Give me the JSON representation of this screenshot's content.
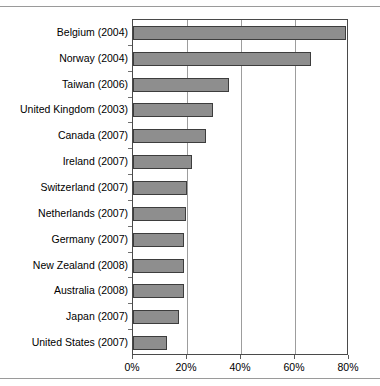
{
  "chart_data": {
    "type": "bar",
    "orientation": "horizontal",
    "title": "",
    "subtitle": "",
    "xlabel": "",
    "ylabel": "",
    "xlim": [
      0,
      80
    ],
    "xtick_labels": [
      "0%",
      "20%",
      "40%",
      "60%",
      "80%"
    ],
    "xtick_values": [
      0,
      20,
      40,
      60,
      80
    ],
    "grid": "vertical",
    "legend": "none",
    "units": "percent",
    "bar_color": "#8e8e8e",
    "bar_border_color": "#3d3d3d",
    "axis_color": "#4a4a4a",
    "gridline_color": "#9d9d9d",
    "categories": [
      "Belgium (2004)",
      "Norway (2004)",
      "Taiwan (2006)",
      "United Kingdom (2003)",
      "Canada (2007)",
      "Ireland (2007)",
      "Switzerland (2007)",
      "Netherlands (2007)",
      "Germany (2007)",
      "New Zealand (2008)",
      "Australia (2008)",
      "Japan (2007)",
      "United States (2007)"
    ],
    "values": [
      79,
      66,
      35.5,
      29.5,
      27,
      22,
      20,
      19.5,
      19,
      19,
      19,
      17,
      12.5
    ]
  },
  "figure": {
    "top_rule": "",
    "bottom_rule": ""
  }
}
